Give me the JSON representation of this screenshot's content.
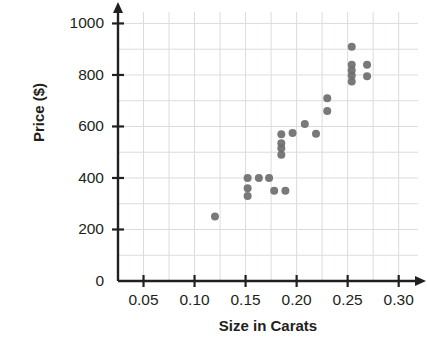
{
  "chart_data": {
    "type": "scatter",
    "title": "",
    "xlabel": "Size in Carats",
    "ylabel": "Price ($)",
    "xlim": [
      0.025,
      0.315
    ],
    "ylim": [
      0,
      1060
    ],
    "xticks": [
      "0.05",
      "0.10",
      "0.15",
      "0.20",
      "0.25",
      "0.30"
    ],
    "xtick_values": [
      0.05,
      0.1,
      0.15,
      0.2,
      0.25,
      0.3
    ],
    "yticks": [
      "0",
      "200",
      "400",
      "600",
      "800",
      "1000"
    ],
    "ytick_values": [
      0,
      200,
      400,
      600,
      800,
      1000
    ],
    "grid": true,
    "grid_x_step": 0.025,
    "grid_y_step": 100,
    "legend": "none",
    "marker_color": "#6e6e6e",
    "marker_size": 7,
    "points": [
      {
        "x": 0.12,
        "y": 250
      },
      {
        "x": 0.152,
        "y": 400
      },
      {
        "x": 0.152,
        "y": 360
      },
      {
        "x": 0.152,
        "y": 330
      },
      {
        "x": 0.163,
        "y": 400
      },
      {
        "x": 0.173,
        "y": 400
      },
      {
        "x": 0.178,
        "y": 350
      },
      {
        "x": 0.189,
        "y": 350
      },
      {
        "x": 0.185,
        "y": 570
      },
      {
        "x": 0.185,
        "y": 535
      },
      {
        "x": 0.185,
        "y": 515
      },
      {
        "x": 0.185,
        "y": 490
      },
      {
        "x": 0.196,
        "y": 575
      },
      {
        "x": 0.208,
        "y": 610
      },
      {
        "x": 0.219,
        "y": 572
      },
      {
        "x": 0.23,
        "y": 710
      },
      {
        "x": 0.23,
        "y": 660
      },
      {
        "x": 0.254,
        "y": 910
      },
      {
        "x": 0.254,
        "y": 840
      },
      {
        "x": 0.254,
        "y": 818
      },
      {
        "x": 0.254,
        "y": 798
      },
      {
        "x": 0.254,
        "y": 775
      },
      {
        "x": 0.269,
        "y": 840
      },
      {
        "x": 0.269,
        "y": 795
      }
    ]
  },
  "colors": {
    "axis": "#231f20",
    "grid": "#d9dce3",
    "marker": "#6e6e6e",
    "background": "#ffffff"
  }
}
